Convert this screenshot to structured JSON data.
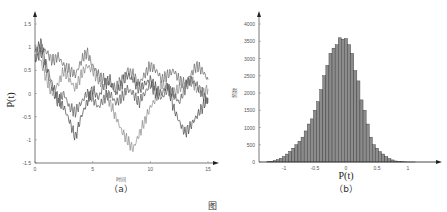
{
  "chart_data": [
    {
      "id": "a",
      "type": "line",
      "panel_label": "（a）",
      "xlabel": "时间",
      "ylabel": "P(t)",
      "xlim": [
        0,
        15
      ],
      "ylim": [
        -1.5,
        1.5
      ],
      "xticks": [
        "0",
        "5",
        "10",
        "15"
      ],
      "yticks": [
        "1.5",
        "1",
        "0.5",
        "0",
        "-0.5",
        "-1",
        "-1.5"
      ],
      "grid": false,
      "legend": null,
      "series": [
        {
          "name": "trajectory-1",
          "color": "#444444",
          "x": [
            0,
            0.5,
            1,
            1.5,
            2,
            2.5,
            3,
            3.5,
            4,
            4.5,
            5,
            5.5,
            6,
            6.5,
            7,
            7.5,
            8,
            8.5,
            9,
            9.5,
            10,
            10.5,
            11,
            11.5,
            12,
            12.5,
            13,
            13.5,
            14,
            14.5,
            15
          ],
          "y": [
            0.9,
            1.1,
            0.6,
            0.2,
            -0.1,
            -0.3,
            -0.6,
            -0.95,
            -0.5,
            -0.2,
            0.1,
            -0.1,
            0.2,
            0.3,
            0.0,
            0.2,
            0.4,
            0.3,
            0.1,
            0.2,
            0.3,
            0.1,
            0.0,
            0.2,
            -0.3,
            -0.6,
            -0.85,
            -0.7,
            -0.5,
            -0.3,
            -0.1
          ]
        },
        {
          "name": "trajectory-2",
          "color": "#666666",
          "x": [
            0,
            0.5,
            1,
            1.5,
            2,
            2.5,
            3,
            3.5,
            4,
            4.5,
            5,
            5.5,
            6,
            6.5,
            7,
            7.5,
            8,
            8.5,
            9,
            9.5,
            10,
            10.5,
            11,
            11.5,
            12,
            12.5,
            13,
            13.5,
            14,
            14.5,
            15
          ],
          "y": [
            0.8,
            1.0,
            0.9,
            0.7,
            0.8,
            0.6,
            0.5,
            0.4,
            0.7,
            0.9,
            0.6,
            0.4,
            0.3,
            0.2,
            0.1,
            0.3,
            0.5,
            0.4,
            0.2,
            0.4,
            0.6,
            0.5,
            0.3,
            0.4,
            0.5,
            0.3,
            0.2,
            0.4,
            0.6,
            0.5,
            0.3
          ]
        },
        {
          "name": "trajectory-3",
          "color": "#888888",
          "x": [
            0,
            0.5,
            1,
            1.5,
            2,
            2.5,
            3,
            3.5,
            4,
            4.5,
            5,
            5.5,
            6,
            6.5,
            7,
            7.5,
            8,
            8.5,
            9,
            9.5,
            10,
            10.5,
            11,
            11.5,
            12,
            12.5,
            13,
            13.5,
            14,
            14.5,
            15
          ],
          "y": [
            1.0,
            0.7,
            0.3,
            0.0,
            0.2,
            0.5,
            0.3,
            0.1,
            0.4,
            0.6,
            0.5,
            0.3,
            0.1,
            -0.2,
            -0.5,
            -0.8,
            -1.0,
            -1.2,
            -0.9,
            -0.6,
            -0.3,
            -0.1,
            0.2,
            0.1,
            0.0,
            0.1,
            0.2,
            0.3,
            0.1,
            0.0,
            0.1
          ]
        },
        {
          "name": "trajectory-4",
          "color": "#555555",
          "x": [
            0,
            0.5,
            1,
            1.5,
            2,
            2.5,
            3,
            3.5,
            4,
            4.5,
            5,
            5.5,
            6,
            6.5,
            7,
            7.5,
            8,
            8.5,
            9,
            9.5,
            10,
            10.5,
            11,
            11.5,
            12,
            12.5,
            13,
            13.5,
            14,
            14.5,
            15
          ],
          "y": [
            0.7,
            0.9,
            0.5,
            0.1,
            -0.2,
            0.0,
            -0.3,
            -0.4,
            -0.2,
            0.0,
            -0.1,
            -0.3,
            -0.1,
            0.0,
            -0.2,
            -0.1,
            0.1,
            0.0,
            -0.2,
            0.0,
            0.2,
            0.0,
            -0.1,
            0.1,
            0.0,
            -0.2,
            0.1,
            0.3,
            0.2,
            0.0,
            -0.2
          ]
        }
      ]
    },
    {
      "id": "b",
      "type": "bar",
      "panel_label": "（b）",
      "xlabel": "P(t)",
      "ylabel": "频数",
      "xlim": [
        -1.4,
        1.6
      ],
      "ylim": [
        0,
        4200
      ],
      "xticks": [
        "-1",
        "-0.5",
        "0",
        "0.5",
        "1"
      ],
      "yticks": [
        "4000",
        "3500",
        "3000",
        "2500",
        "2000",
        "1500",
        "1000",
        "500",
        "0"
      ],
      "grid": false,
      "legend": null,
      "bar_color": "#8c8c8c",
      "bin_width": 0.05,
      "categories": [
        -1.25,
        -1.2,
        -1.15,
        -1.1,
        -1.05,
        -1.0,
        -0.95,
        -0.9,
        -0.85,
        -0.8,
        -0.75,
        -0.7,
        -0.65,
        -0.6,
        -0.55,
        -0.5,
        -0.45,
        -0.4,
        -0.35,
        -0.3,
        -0.25,
        -0.2,
        -0.15,
        -0.1,
        -0.05,
        0.0,
        0.05,
        0.1,
        0.15,
        0.2,
        0.25,
        0.3,
        0.35,
        0.4,
        0.45,
        0.5,
        0.55,
        0.6,
        0.65,
        0.7,
        0.75,
        0.8,
        0.85,
        0.9,
        0.95,
        1.0,
        1.05,
        1.1,
        1.15,
        1.2
      ],
      "values": [
        10,
        20,
        40,
        70,
        110,
        160,
        230,
        310,
        400,
        500,
        600,
        720,
        900,
        1100,
        1250,
        1500,
        1750,
        2100,
        2500,
        2800,
        3150,
        3300,
        3400,
        3600,
        3560,
        3580,
        3400,
        3150,
        2650,
        2350,
        1800,
        1500,
        1100,
        720,
        500,
        400,
        300,
        230,
        160,
        100,
        60,
        30,
        15,
        8,
        4,
        2,
        1,
        1,
        0,
        0
      ]
    }
  ],
  "figure": {
    "caption_prefix": "图"
  }
}
